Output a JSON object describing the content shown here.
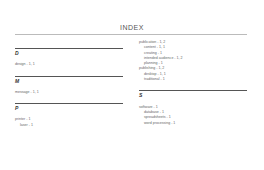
{
  "header": {
    "title": "INDEX"
  },
  "left_column": {
    "sections": [
      {
        "letter": "D",
        "entries": [
          {
            "text": "design - 1, 1",
            "level": 0
          }
        ]
      },
      {
        "letter": "M",
        "entries": [
          {
            "text": "message - 1, 1",
            "level": 0
          }
        ]
      },
      {
        "letter": "P",
        "entries": [
          {
            "text": "printer - 1",
            "level": 0
          },
          {
            "text": "laser - 1",
            "level": 1
          }
        ]
      }
    ]
  },
  "right_column": {
    "top_entries": [
      {
        "text": "publication - 1, 2",
        "level": 0
      },
      {
        "text": "content - 1, 1",
        "level": 1
      },
      {
        "text": "creating - 1",
        "level": 1
      },
      {
        "text": "intended audience - 1, 2",
        "level": 1
      },
      {
        "text": "planning - 1",
        "level": 1
      },
      {
        "text": "publishing - 1, 2",
        "level": 0
      },
      {
        "text": "desktop - 1, 1",
        "level": 1
      },
      {
        "text": "traditional - 1",
        "level": 1
      }
    ],
    "sections": [
      {
        "letter": "S",
        "entries": [
          {
            "text": "software - 1",
            "level": 0
          },
          {
            "text": "database - 1",
            "level": 1
          },
          {
            "text": "spreadsheets - 1",
            "level": 1
          },
          {
            "text": "word processing - 1",
            "level": 1
          }
        ]
      }
    ]
  }
}
